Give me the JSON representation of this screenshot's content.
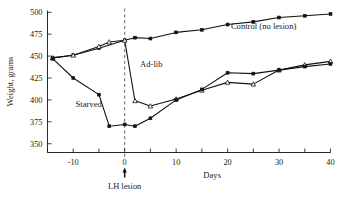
{
  "chart_data": {
    "type": "line",
    "title": "",
    "xlabel": "Days",
    "ylabel": "Weight, grams",
    "xlim": [
      -15,
      40
    ],
    "ylim": [
      340,
      502
    ],
    "grid": false,
    "legend_position": "inline-annotation",
    "y_ticks": [
      350,
      375,
      400,
      425,
      450,
      475,
      500
    ],
    "y_tick_labels": [
      "350",
      "375",
      "400",
      "425",
      "450",
      "475",
      "500"
    ],
    "x_ticks": [
      -15,
      -10,
      -5,
      0,
      5,
      10,
      15,
      20,
      25,
      30,
      35,
      40
    ],
    "x_tick_labels": [
      "-10",
      "0",
      "10",
      "20",
      "30",
      "40"
    ],
    "x_labeled_ticks": [
      -10,
      0,
      10,
      20,
      30,
      40
    ],
    "annotations": [
      {
        "name": "lh-lesion",
        "text": "LH lesion",
        "x": 0,
        "note": "vertical dashed line at day 0 with up arrow below axis"
      },
      {
        "name": "control-label",
        "text": "Control (no lesion)",
        "x": 27,
        "y": 481
      },
      {
        "name": "adlib-label",
        "text": "Ad-lib",
        "x": 3,
        "y": 437
      },
      {
        "name": "starved-label",
        "text": "Starved",
        "x": -7,
        "y": 392
      }
    ],
    "series": [
      {
        "name": "Control (no lesion)",
        "marker": "filled-square",
        "x": [
          -14,
          -10,
          -5,
          0,
          2,
          5,
          10,
          15,
          20,
          25,
          30,
          35,
          40
        ],
        "values": [
          448,
          451,
          459,
          468,
          471,
          470,
          477,
          480,
          486,
          489,
          494,
          496,
          498
        ]
      },
      {
        "name": "Ad-lib",
        "marker": "open-triangle",
        "x": [
          -14,
          -10,
          -5,
          -3,
          0,
          2,
          5,
          10,
          15,
          20,
          25,
          30,
          35,
          40
        ],
        "values": [
          448,
          451,
          461,
          466,
          468,
          399,
          393,
          401,
          411,
          420,
          418,
          434,
          440,
          444
        ]
      },
      {
        "name": "Starved",
        "marker": "filled-square",
        "x": [
          -14,
          -10,
          -5,
          -3,
          0,
          2,
          5,
          10,
          15,
          20,
          25,
          30,
          35,
          40
        ],
        "values": [
          447,
          425,
          406,
          370,
          372,
          370,
          379,
          400,
          412,
          431,
          430,
          434,
          438,
          441
        ]
      }
    ]
  }
}
